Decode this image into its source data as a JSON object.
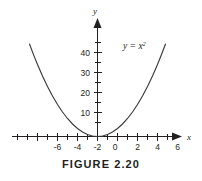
{
  "figure": {
    "caption": "FIGURE 2.20",
    "curve_label_base": "y = x",
    "curve_label_exponent": "2",
    "background_color": "#ffffff",
    "curve_color": "#3b3a3c",
    "axis_color": "#231f20"
  },
  "chart_data": {
    "type": "line",
    "title": "FIGURE 2.20",
    "annotations": [
      "y = x2"
    ],
    "xlabel": "x",
    "ylabel": "y",
    "xlim": [
      -7.2,
      7.2
    ],
    "ylim": [
      -2,
      50
    ],
    "grid": false,
    "legend": "none",
    "x_major_ticks": [
      -6,
      -4,
      -2,
      0,
      2,
      4,
      6
    ],
    "x_major_tick_labels": [
      "-6",
      "-4",
      "-2",
      "0",
      "2",
      "4",
      "6"
    ],
    "x_minor_ticks": [
      -7,
      -5,
      -3,
      -1,
      1,
      3,
      5,
      7
    ],
    "y_major_ticks": [
      10,
      20,
      30,
      40
    ],
    "y_major_tick_labels": [
      "10",
      "20",
      "30",
      "40"
    ],
    "y_minor_ticks": [
      5,
      15,
      25,
      35,
      45
    ],
    "series": [
      {
        "name": "y = x2",
        "equation": "y = x^2",
        "x": [
          -6.8,
          -6.4,
          -6,
          -5.5,
          -5,
          -4.5,
          -4,
          -3.5,
          -3,
          -2.5,
          -2,
          -1.5,
          -1,
          -0.5,
          0,
          0.5,
          1,
          1.5,
          2,
          2.5,
          3,
          3.5,
          4,
          4.5,
          5,
          5.5,
          6,
          6.4,
          6.8
        ],
        "y": [
          46.24,
          40.96,
          36,
          30.25,
          25,
          20.25,
          16,
          12.25,
          9,
          6.25,
          4,
          2.25,
          1,
          0.25,
          0,
          0.25,
          1,
          2.25,
          4,
          6.25,
          9,
          12.25,
          16,
          20.25,
          25,
          30.25,
          36,
          40.96,
          46.24
        ]
      }
    ]
  }
}
